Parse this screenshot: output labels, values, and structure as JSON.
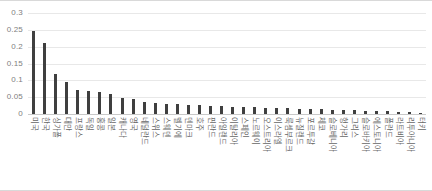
{
  "chart_data": {
    "type": "bar",
    "title": "",
    "subtitle": "",
    "xlabel": "",
    "ylabel": "",
    "ylim": [
      0,
      0.3
    ],
    "grid": true,
    "legend": false,
    "legend_position": "none",
    "ytick_labels": [
      "0.3",
      "0.25",
      "0.2",
      "0.15",
      "0.1",
      "0.05",
      "0"
    ],
    "ytick_values": [
      0.3,
      0.25,
      0.2,
      0.15,
      0.1,
      0.05,
      0
    ],
    "bar_color": "#3f3f3f",
    "categories": [
      "미국",
      "한국",
      "싱가폴",
      "대만",
      "프랑스",
      "독일",
      "홍콩",
      "일본",
      "캐나다",
      "영국",
      "네덜란드",
      "스위스",
      "스웨덴",
      "벨기에",
      "덴마크",
      "호주",
      "핀란드",
      "아일랜드",
      "이탈리아",
      "스페인",
      "노르웨이",
      "오스트리아",
      "이스라엘",
      "룩셈부르크",
      "뉴질랜드",
      "포르투갈",
      "체코",
      "슬로베니아",
      "헝가리",
      "그리스",
      "슬로바키아",
      "에스토니아",
      "폴란드",
      "라트비아",
      "리투아니아",
      "터키"
    ],
    "values": [
      0.248,
      0.21,
      0.118,
      0.096,
      0.072,
      0.069,
      0.064,
      0.059,
      0.047,
      0.044,
      0.037,
      0.034,
      0.031,
      0.03,
      0.027,
      0.026,
      0.024,
      0.023,
      0.022,
      0.021,
      0.02,
      0.019,
      0.018,
      0.017,
      0.016,
      0.015,
      0.014,
      0.013,
      0.012,
      0.011,
      0.01,
      0.009,
      0.008,
      0.006,
      0.005,
      0.003
    ]
  }
}
